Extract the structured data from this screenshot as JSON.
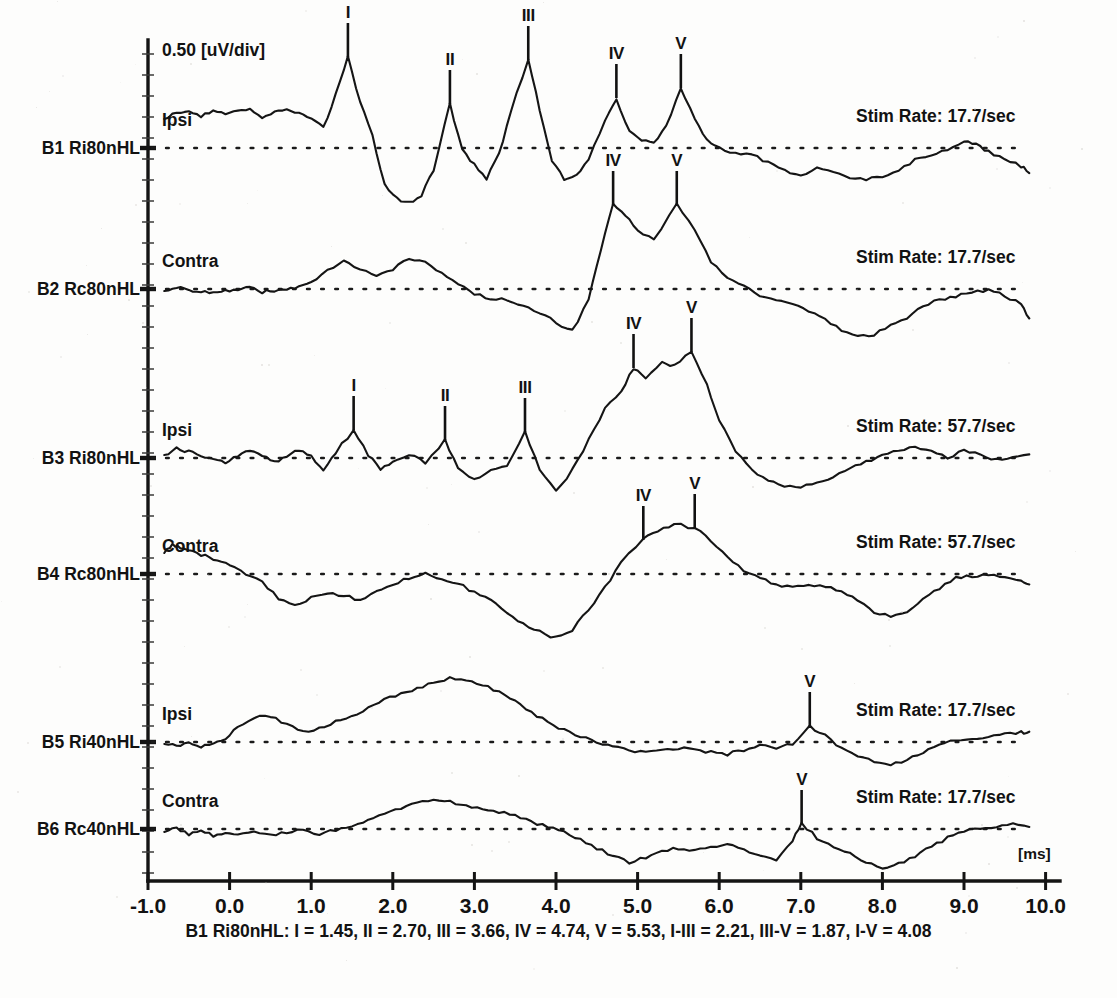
{
  "header": {
    "scale_label": "0.50 [uV/div]",
    "time_unit_label": "[ms]"
  },
  "caption": "B1 Ri80nHL: I = 1.45, II = 2.70, III = 3.66, IV = 4.74, V = 5.53, I-III = 2.21, III-V = 1.87, I-V = 4.08",
  "footnote": "",
  "axis": {
    "x_ticks": [
      "-1.0",
      "0.0",
      "1.0",
      "2.0",
      "3.0",
      "4.0",
      "5.0",
      "6.0",
      "7.0",
      "8.0",
      "9.0",
      "10.0"
    ],
    "x_min": -1.0,
    "x_max": 10.0,
    "x_label": "[ms]",
    "y_label": "0.50 [uV/div]",
    "y_div_uv": 0.5,
    "grid": false
  },
  "traces": [
    {
      "id": "B1",
      "label": "B1 Ri80nHL",
      "channel": "Ipsi",
      "stim_rate": "Stim Rate: 17.7/sec",
      "peaks": [
        {
          "name": "I",
          "latency_ms": 1.45
        },
        {
          "name": "II",
          "latency_ms": 2.7
        },
        {
          "name": "III",
          "latency_ms": 3.66
        },
        {
          "name": "IV",
          "latency_ms": 4.74
        },
        {
          "name": "V",
          "latency_ms": 5.53
        }
      ]
    },
    {
      "id": "B2",
      "label": "B2 Rc80nHL",
      "channel": "Contra",
      "stim_rate": "Stim Rate: 17.7/sec",
      "peaks": [
        {
          "name": "IV",
          "latency_ms": 4.7
        },
        {
          "name": "V",
          "latency_ms": 5.48
        }
      ]
    },
    {
      "id": "B3",
      "label": "B3 Ri80nHL",
      "channel": "Ipsi",
      "stim_rate": "Stim Rate: 57.7/sec",
      "peaks": [
        {
          "name": "I",
          "latency_ms": 1.52
        },
        {
          "name": "II",
          "latency_ms": 2.64
        },
        {
          "name": "III",
          "latency_ms": 3.62
        },
        {
          "name": "IV",
          "latency_ms": 4.95
        },
        {
          "name": "V",
          "latency_ms": 5.66
        }
      ]
    },
    {
      "id": "B4",
      "label": "B4 Rc80nHL",
      "channel": "Contra",
      "stim_rate": "Stim Rate: 57.7/sec",
      "peaks": [
        {
          "name": "IV",
          "latency_ms": 5.07
        },
        {
          "name": "V",
          "latency_ms": 5.7
        }
      ]
    },
    {
      "id": "B5",
      "label": "B5 Ri40nHL",
      "channel": "Ipsi",
      "stim_rate": "Stim Rate: 17.7/sec",
      "peaks": [
        {
          "name": "V",
          "latency_ms": 7.11
        }
      ]
    },
    {
      "id": "B6",
      "label": "B6 Rc40nHL",
      "channel": "Contra",
      "stim_rate": "Stim Rate: 17.7/sec",
      "peaks": [
        {
          "name": "V",
          "latency_ms": 7.01
        }
      ]
    }
  ],
  "chart_data": {
    "type": "line",
    "xlabel": "[ms]",
    "ylabel": "0.50 [uV/div]",
    "xlim": [
      -1.0,
      10.0
    ],
    "grid": false,
    "legend": "none",
    "series": [
      {
        "name": "B1 Ri80nHL",
        "channel": "Ipsi",
        "stim_rate_per_sec": 17.7,
        "baseline_y_px": 148,
        "x": [
          -0.8,
          -0.65,
          -0.5,
          -0.35,
          -0.2,
          -0.05,
          0.1,
          0.25,
          0.4,
          0.55,
          0.7,
          0.85,
          1.0,
          1.15,
          1.3,
          1.45,
          1.6,
          1.75,
          1.9,
          2.05,
          2.2,
          2.35,
          2.5,
          2.7,
          2.85,
          3.0,
          3.15,
          3.3,
          3.45,
          3.66,
          3.8,
          3.95,
          4.1,
          4.25,
          4.4,
          4.6,
          4.74,
          4.9,
          5.05,
          5.2,
          5.35,
          5.53,
          5.7,
          5.85,
          6.0,
          6.2,
          6.4,
          6.6,
          6.8,
          7.0,
          7.2,
          7.4,
          7.6,
          7.8,
          8.0,
          8.2,
          8.4,
          8.6,
          8.8,
          9.0,
          9.15,
          9.3,
          9.5,
          9.7,
          9.8
        ],
        "y_px": [
          119,
          113,
          112,
          116,
          110,
          113,
          110,
          110,
          117,
          113,
          110,
          112,
          118,
          128,
          95,
          57,
          102,
          135,
          185,
          199,
          203,
          196,
          170,
          104,
          150,
          165,
          178,
          155,
          110,
          60,
          110,
          160,
          180,
          176,
          160,
          120,
          98,
          132,
          140,
          143,
          126,
          88,
          120,
          141,
          148,
          153,
          155,
          162,
          170,
          175,
          168,
          172,
          178,
          180,
          176,
          170,
          160,
          155,
          150,
          140,
          144,
          152,
          158,
          166,
          172
        ]
      },
      {
        "name": "B2 Rc80nHL",
        "channel": "Contra",
        "stim_rate_per_sec": 17.7,
        "baseline_y_px": 289,
        "x": [
          -0.8,
          -0.65,
          -0.5,
          -0.35,
          -0.2,
          -0.05,
          0.1,
          0.25,
          0.4,
          0.55,
          0.7,
          0.85,
          1.0,
          1.2,
          1.4,
          1.6,
          1.8,
          2.0,
          2.2,
          2.4,
          2.6,
          2.8,
          3.0,
          3.2,
          3.4,
          3.6,
          3.8,
          4.0,
          4.2,
          4.4,
          4.55,
          4.7,
          4.85,
          5.0,
          5.2,
          5.48,
          5.7,
          5.9,
          6.1,
          6.3,
          6.5,
          6.7,
          6.9,
          7.1,
          7.3,
          7.5,
          7.7,
          7.9,
          8.1,
          8.3,
          8.5,
          8.7,
          8.9,
          9.1,
          9.3,
          9.5,
          9.7,
          9.8
        ],
        "y_px": [
          291,
          287,
          290,
          292,
          293,
          291,
          290,
          288,
          292,
          291,
          290,
          287,
          283,
          270,
          262,
          268,
          277,
          270,
          258,
          263,
          272,
          283,
          294,
          298,
          300,
          305,
          312,
          323,
          331,
          300,
          250,
          205,
          215,
          230,
          240,
          205,
          230,
          262,
          278,
          286,
          296,
          300,
          304,
          312,
          320,
          330,
          337,
          334,
          325,
          318,
          305,
          300,
          296,
          293,
          290,
          296,
          304,
          318
        ]
      },
      {
        "name": "B3 Ri80nHL",
        "channel": "Ipsi",
        "stim_rate_per_sec": 57.7,
        "baseline_y_px": 458,
        "x": [
          -0.8,
          -0.65,
          -0.5,
          -0.35,
          -0.2,
          -0.05,
          0.1,
          0.25,
          0.4,
          0.55,
          0.7,
          0.85,
          1.0,
          1.15,
          1.3,
          1.52,
          1.7,
          1.85,
          2.0,
          2.2,
          2.4,
          2.64,
          2.8,
          3.0,
          3.2,
          3.4,
          3.62,
          3.8,
          4.0,
          4.2,
          4.4,
          4.6,
          4.8,
          4.95,
          5.1,
          5.3,
          5.45,
          5.66,
          5.85,
          6.0,
          6.2,
          6.4,
          6.6,
          6.8,
          7.0,
          7.2,
          7.4,
          7.6,
          7.8,
          8.0,
          8.2,
          8.4,
          8.6,
          8.8,
          9.0,
          9.2,
          9.4,
          9.6,
          9.8
        ],
        "y_px": [
          455,
          448,
          452,
          456,
          460,
          462,
          455,
          450,
          456,
          462,
          456,
          450,
          456,
          472,
          452,
          430,
          455,
          470,
          462,
          455,
          462,
          440,
          468,
          480,
          470,
          466,
          432,
          470,
          492,
          470,
          440,
          408,
          392,
          368,
          380,
          362,
          366,
          352,
          384,
          420,
          450,
          470,
          480,
          486,
          488,
          482,
          478,
          468,
          462,
          456,
          450,
          448,
          452,
          458,
          450,
          454,
          460,
          458,
          456
        ]
      },
      {
        "name": "B4 Rc80nHL",
        "channel": "Contra",
        "stim_rate_per_sec": 57.7,
        "baseline_y_px": 574,
        "x": [
          -0.8,
          -0.7,
          -0.6,
          -0.45,
          -0.3,
          -0.15,
          0.0,
          0.2,
          0.4,
          0.6,
          0.8,
          1.0,
          1.2,
          1.4,
          1.6,
          1.8,
          2.0,
          2.2,
          2.4,
          2.6,
          2.8,
          3.0,
          3.2,
          3.4,
          3.6,
          3.8,
          4.0,
          4.2,
          4.4,
          4.6,
          4.8,
          5.07,
          5.25,
          5.45,
          5.7,
          5.9,
          6.1,
          6.3,
          6.5,
          6.7,
          6.9,
          7.1,
          7.3,
          7.5,
          7.7,
          7.9,
          8.1,
          8.3,
          8.5,
          8.7,
          8.9,
          9.1,
          9.3,
          9.5,
          9.7,
          9.8
        ],
        "y_px": [
          553,
          545,
          548,
          552,
          556,
          560,
          566,
          574,
          582,
          598,
          606,
          598,
          592,
          596,
          600,
          592,
          584,
          578,
          574,
          578,
          584,
          592,
          600,
          612,
          624,
          632,
          638,
          630,
          610,
          588,
          562,
          540,
          530,
          524,
          528,
          540,
          556,
          570,
          578,
          584,
          588,
          584,
          586,
          592,
          600,
          612,
          616,
          612,
          600,
          588,
          578,
          576,
          574,
          576,
          580,
          584
        ]
      },
      {
        "name": "B5 Ri40nHL",
        "channel": "Ipsi",
        "stim_rate_per_sec": 17.7,
        "baseline_y_px": 742,
        "x": [
          -0.8,
          -0.65,
          -0.5,
          -0.35,
          -0.2,
          -0.05,
          0.1,
          0.3,
          0.5,
          0.7,
          0.9,
          1.1,
          1.3,
          1.5,
          1.7,
          1.9,
          2.1,
          2.3,
          2.5,
          2.7,
          2.9,
          3.1,
          3.3,
          3.5,
          3.7,
          3.9,
          4.1,
          4.3,
          4.5,
          4.7,
          4.9,
          5.1,
          5.3,
          5.5,
          5.7,
          5.9,
          6.1,
          6.3,
          6.5,
          6.7,
          6.9,
          7.11,
          7.3,
          7.5,
          7.7,
          7.9,
          8.1,
          8.3,
          8.5,
          8.7,
          8.9,
          9.1,
          9.3,
          9.5,
          9.7,
          9.8
        ],
        "y_px": [
          744,
          746,
          744,
          746,
          742,
          738,
          728,
          718,
          716,
          724,
          732,
          728,
          722,
          716,
          708,
          700,
          694,
          688,
          682,
          678,
          680,
          684,
          692,
          700,
          712,
          722,
          730,
          736,
          742,
          746,
          750,
          752,
          750,
          748,
          750,
          752,
          754,
          750,
          746,
          748,
          744,
          726,
          736,
          748,
          756,
          762,
          764,
          760,
          752,
          744,
          740,
          738,
          736,
          734,
          732,
          733
        ]
      },
      {
        "name": "B6 Rc40nHL",
        "channel": "Contra",
        "stim_rate_per_sec": 17.7,
        "baseline_y_px": 829,
        "x": [
          -0.8,
          -0.65,
          -0.5,
          -0.35,
          -0.2,
          -0.05,
          0.1,
          0.3,
          0.5,
          0.7,
          0.9,
          1.1,
          1.3,
          1.5,
          1.7,
          1.9,
          2.1,
          2.3,
          2.5,
          2.7,
          2.9,
          3.1,
          3.3,
          3.5,
          3.7,
          3.9,
          4.1,
          4.3,
          4.5,
          4.7,
          4.9,
          5.1,
          5.3,
          5.5,
          5.7,
          5.9,
          6.1,
          6.3,
          6.5,
          6.7,
          6.9,
          7.01,
          7.2,
          7.4,
          7.6,
          7.8,
          8.0,
          8.2,
          8.4,
          8.6,
          8.8,
          9.0,
          9.2,
          9.4,
          9.6,
          9.8
        ],
        "y_px": [
          832,
          828,
          834,
          830,
          836,
          832,
          834,
          830,
          836,
          832,
          830,
          834,
          830,
          826,
          820,
          814,
          808,
          804,
          800,
          802,
          806,
          808,
          812,
          816,
          822,
          826,
          832,
          840,
          848,
          856,
          862,
          858,
          852,
          848,
          850,
          848,
          844,
          850,
          856,
          860,
          840,
          824,
          838,
          846,
          854,
          862,
          868,
          864,
          856,
          846,
          838,
          832,
          828,
          826,
          824,
          826
        ]
      }
    ]
  }
}
